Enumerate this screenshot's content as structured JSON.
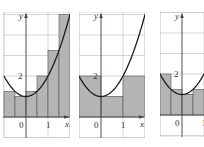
{
  "figure": {
    "function": "y = x^2 + 1",
    "colors": {
      "background": "#ffffff",
      "grid": "#b8b8b8",
      "axis": "#444444",
      "rect_fill": "#b4b4b4",
      "rect_stroke": "#555555",
      "curve": "#1a1a1a",
      "frame": "#cccccc"
    },
    "panels": [
      {
        "id": "panel-1",
        "method": "right endpoints",
        "n": 6,
        "dx": 0.5,
        "x_range": [
          -1,
          2
        ],
        "y_range": [
          -1,
          5.1
        ],
        "rect_heights": [
          1.25,
          1,
          1.25,
          2,
          3.25,
          5
        ],
        "labels": {
          "y_axis": "y",
          "x_axis": "x",
          "origin": "0",
          "x_tick": "1",
          "y_tick": "2"
        }
      },
      {
        "id": "panel-2",
        "method": "left endpoints",
        "n": 3,
        "dx": 1,
        "x_range": [
          -1,
          2
        ],
        "y_range": [
          -1,
          5.1
        ],
        "rect_heights": [
          2,
          1,
          2
        ],
        "labels": {
          "y_axis": "y",
          "x_axis": "x",
          "origin": "0",
          "x_tick": "1",
          "y_tick": "2"
        }
      },
      {
        "id": "panel-3",
        "method": "left endpoints",
        "n": 4,
        "dx": 0.5,
        "x_range": [
          -1,
          1
        ],
        "y_range": [
          -1,
          5.1
        ],
        "rect_heights": [
          2,
          1.25,
          1,
          1.25
        ],
        "labels": {
          "y_axis": "y",
          "x_axis": "x",
          "origin": "0",
          "x_tick": "1",
          "y_tick": "2"
        }
      }
    ]
  }
}
